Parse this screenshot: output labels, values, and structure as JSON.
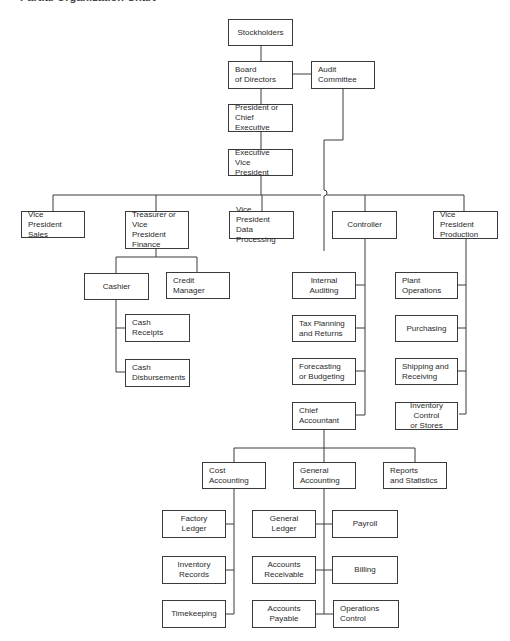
{
  "title": "Partial Organization Chart",
  "nodes": {
    "stockholders": "Stockholders",
    "board": "Board\nof Directors",
    "audit_committee": "Audit\nCommittee",
    "president": "President or\nChief Executive",
    "exec_vp": "Executive\nVice President",
    "vp_sales": "Vice President\nSales",
    "treasurer": "Treasurer or\nVice President\nFinance",
    "vp_data": "Vice President\nData Processing",
    "controller": "Controller",
    "vp_production": "Vice President\nProduction",
    "cashier": "Cashier",
    "credit_manager": "Credit\nManager",
    "cash_receipts": "Cash\nReceipts",
    "cash_disbursements": "Cash\nDisbursements",
    "internal_auditing": "Internal\nAuditing",
    "tax_planning": "Tax Planning\nand Returns",
    "forecasting": "Forecasting\nor Budgeting",
    "chief_accountant": "Chief\nAccountant",
    "plant_operations": "Plant\nOperations",
    "purchasing": "Purchasing",
    "shipping": "Shipping and\nReceiving",
    "inventory_control": "Inventory\nControl\nor Stores",
    "cost_accounting": "Cost\nAccounting",
    "general_accounting": "General\nAccounting",
    "reports": "Reports\nand Statistics",
    "factory_ledger": "Factory\nLedger",
    "inventory_records": "Inventory\nRecords",
    "timekeeping": "Timekeeping",
    "general_ledger": "General\nLedger",
    "accounts_receivable": "Accounts\nReceivable",
    "accounts_payable": "Accounts\nPayable",
    "payroll": "Payroll",
    "billing": "Billing",
    "operations_control": "Operations\nControl"
  },
  "colors": {
    "line": "#3a3a3a",
    "text": "#2a2a2a",
    "background": "#ffffff"
  }
}
